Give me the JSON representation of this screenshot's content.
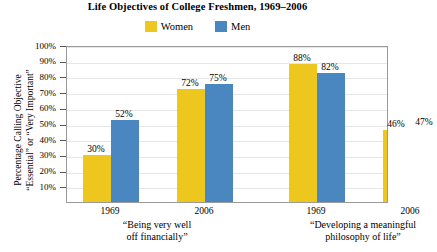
{
  "chart_data": {
    "type": "bar",
    "title": "Life Objectives of College Freshmen, 1969–2006",
    "xlabel": "",
    "ylabel_lines": [
      "Percentage Calling Objective",
      "“Essential” or “Very Important”"
    ],
    "ylim": [
      0,
      100
    ],
    "ytick_labels": [
      "100%",
      "90%",
      "80%",
      "70%",
      "60%",
      "50%",
      "40%",
      "30%",
      "20%",
      "10%"
    ],
    "ytick_values": [
      100,
      90,
      80,
      70,
      60,
      50,
      40,
      30,
      20,
      10
    ],
    "grid": true,
    "legend_position": "top-center",
    "series": [
      {
        "name": "Women",
        "color": "#EDC71D",
        "values": [
          30,
          72,
          88,
          46
        ]
      },
      {
        "name": "Men",
        "color": "#4A86BF",
        "values": [
          52,
          75,
          82,
          47
        ]
      }
    ],
    "categories": [
      "1969",
      "2006",
      "1969",
      "2006"
    ],
    "groups": [
      {
        "label_lines": [
          "“Being very well",
          "off financially”"
        ],
        "years": [
          "1969",
          "2006"
        ]
      },
      {
        "label_lines": [
          "“Developing a meaningful",
          "philosophy of life”"
        ],
        "years": [
          "1969",
          "2006"
        ]
      }
    ],
    "data_labels": [
      "30%",
      "52%",
      "72%",
      "75%",
      "88%",
      "82%",
      "46%",
      "47%"
    ],
    "bars": [
      {
        "group": 0,
        "year": "1969",
        "series": "Women",
        "value": 30,
        "label": "30%",
        "color": "#EDC71D"
      },
      {
        "group": 0,
        "year": "1969",
        "series": "Men",
        "value": 52,
        "label": "52%",
        "color": "#4A86BF"
      },
      {
        "group": 0,
        "year": "2006",
        "series": "Women",
        "value": 72,
        "label": "72%",
        "color": "#EDC71D"
      },
      {
        "group": 0,
        "year": "2006",
        "series": "Men",
        "value": 75,
        "label": "75%",
        "color": "#4A86BF"
      },
      {
        "group": 1,
        "year": "1969",
        "series": "Women",
        "value": 88,
        "label": "88%",
        "color": "#EDC71D"
      },
      {
        "group": 1,
        "year": "1969",
        "series": "Men",
        "value": 82,
        "label": "82%",
        "color": "#4A86BF"
      },
      {
        "group": 1,
        "year": "2006",
        "series": "Women",
        "value": 46,
        "label": "46%",
        "color": "#EDC71D"
      },
      {
        "group": 1,
        "year": "2006",
        "series": "Men",
        "value": 47,
        "label": "47%",
        "color": "#4A86BF"
      }
    ]
  },
  "legend": {
    "items": [
      {
        "label": "Women",
        "color": "#EDC71D"
      },
      {
        "label": "Men",
        "color": "#4A86BF"
      }
    ]
  },
  "colors": {
    "women": "#EDC71D",
    "men": "#4A86BF",
    "axis": "#9a9a9a",
    "gridline": "#e6e6e6",
    "text": "#000000"
  }
}
